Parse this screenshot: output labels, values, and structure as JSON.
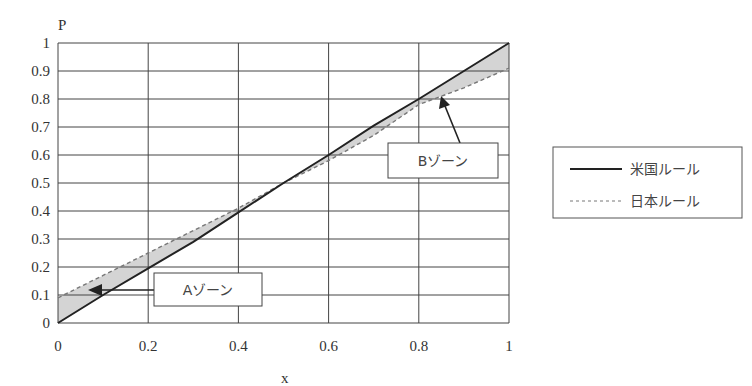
{
  "chart_data": {
    "type": "line",
    "title": "",
    "xlabel": "x",
    "ylabel": "P",
    "xlim": [
      0,
      1
    ],
    "ylim": [
      0,
      1
    ],
    "grid": true,
    "x_ticks": [
      "0",
      "0.2",
      "0.4",
      "0.6",
      "0.8",
      "1"
    ],
    "y_ticks": [
      "0",
      "0.1",
      "0.2",
      "0.3",
      "0.4",
      "0.5",
      "0.6",
      "0.7",
      "0.8",
      "0.9",
      "1"
    ],
    "legend_position": "right",
    "series": [
      {
        "name": "米国ルール",
        "style": "solid",
        "x": [
          0,
          0.1,
          0.2,
          0.3,
          0.4,
          0.5,
          0.6,
          0.7,
          0.8,
          0.9,
          1.0
        ],
        "y": [
          0,
          0.1,
          0.195,
          0.29,
          0.395,
          0.5,
          0.6,
          0.705,
          0.8,
          0.9,
          1.0
        ]
      },
      {
        "name": "日本ルール",
        "style": "dashed",
        "x": [
          0,
          0.1,
          0.2,
          0.3,
          0.4,
          0.5,
          0.6,
          0.7,
          0.8,
          0.9,
          1.0
        ],
        "y": [
          0.09,
          0.17,
          0.25,
          0.33,
          0.41,
          0.5,
          0.58,
          0.67,
          0.78,
          0.84,
          0.91
        ]
      }
    ],
    "annotations": [
      {
        "label": "Aゾーン",
        "target": [
          0.07,
          0.12
        ]
      },
      {
        "label": "Bゾーン",
        "target": [
          0.84,
          0.8
        ]
      }
    ]
  },
  "legend": {
    "items": [
      {
        "label": "米国ルール",
        "style": "solid"
      },
      {
        "label": "日本ルール",
        "style": "dashed"
      }
    ]
  },
  "colors": {
    "grid": "#444444",
    "solid_line": "#222222",
    "dashed_line": "#777777",
    "zone_fill": "#d4d4d4"
  }
}
